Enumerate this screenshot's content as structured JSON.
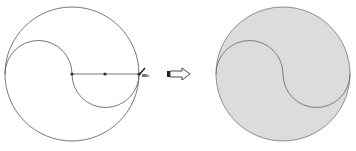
{
  "diagram": {
    "colors": {
      "line": "#555555",
      "point": "#333333",
      "fill": "#dcdcdc",
      "background": "#ffffff"
    },
    "left_sketch": {
      "circle": {
        "cx": 72,
        "cy": 74,
        "r": 67
      },
      "centerline": {
        "x1": 72,
        "y1": 74,
        "x2": 139,
        "y2": 74
      },
      "points": [
        {
          "x": 72,
          "y": 74
        },
        {
          "x": 105,
          "y": 74
        },
        {
          "x": 139,
          "y": 74
        }
      ],
      "cursor_icon": "pencil-cursor-icon"
    },
    "arrow": {
      "icon": "right-arrow-icon",
      "x": 165,
      "y": 74
    },
    "right_result": {
      "circle": {
        "cx": 283,
        "cy": 74,
        "r": 67
      }
    }
  }
}
